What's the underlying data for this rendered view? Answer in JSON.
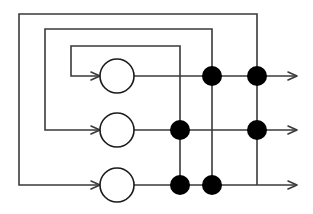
{
  "diagram": {
    "type": "block-diagram",
    "canvas": {
      "width": 313,
      "height": 214
    },
    "style": {
      "background": "#ffffff",
      "line_color": "#3a3a3a",
      "node_fill": "#ffffff",
      "node_stroke": "#1a1a1a",
      "dot_fill": "#000000",
      "line_width": 1.6,
      "dot_radius": 10,
      "circle_radius": 17
    },
    "rows": [
      {
        "name": "row-1",
        "y": 76,
        "circle_cx": 117,
        "output_arrow_x": 297,
        "input_arrow_x": 100
      },
      {
        "name": "row-2",
        "y": 130,
        "circle_cx": 117,
        "output_arrow_x": 297,
        "input_arrow_x": 100
      },
      {
        "name": "row-3",
        "y": 185,
        "circle_cx": 117,
        "output_arrow_x": 297,
        "input_arrow_x": 100
      }
    ],
    "nodes": [
      {
        "name": "node-circle-1",
        "cx": 117,
        "cy": 76,
        "r": 17,
        "kind": "circle"
      },
      {
        "name": "node-circle-2",
        "cx": 117,
        "cy": 130,
        "r": 17,
        "kind": "circle"
      },
      {
        "name": "node-circle-3",
        "cx": 117,
        "cy": 185,
        "r": 17,
        "kind": "circle"
      }
    ],
    "dots": [
      {
        "name": "junction-dot-r1-c2",
        "cx": 212,
        "cy": 76,
        "r": 10
      },
      {
        "name": "junction-dot-r1-c3",
        "cx": 257,
        "cy": 76,
        "r": 10
      },
      {
        "name": "junction-dot-r2-c1",
        "cx": 180,
        "cy": 130,
        "r": 10
      },
      {
        "name": "junction-dot-r2-c3",
        "cx": 257,
        "cy": 130,
        "r": 10
      },
      {
        "name": "junction-dot-r3-c1",
        "cx": 180,
        "cy": 185,
        "r": 10
      },
      {
        "name": "junction-dot-r3-c2",
        "cx": 212,
        "cy": 185,
        "r": 10
      }
    ],
    "feedback_loops": [
      {
        "name": "feedback-loop-outer",
        "tap_x": 257,
        "top_y": 14,
        "left_x": 19,
        "target_row_y": 185
      },
      {
        "name": "feedback-loop-middle",
        "tap_x": 212,
        "top_y": 29,
        "left_x": 45,
        "target_row_y": 130
      },
      {
        "name": "feedback-loop-inner",
        "tap_x": 180,
        "top_y": 46,
        "left_x": 71,
        "target_row_y": 76
      }
    ],
    "vertical_links": [
      {
        "name": "vlink-c1-r2-to-r3",
        "x": 180,
        "y1": 130,
        "y2": 185
      },
      {
        "name": "vlink-c2-r1-to-r3",
        "x": 212,
        "y1": 76,
        "y2": 185
      },
      {
        "name": "vlink-c3-r1-to-r3",
        "x": 257,
        "y1": 76,
        "y2": 185
      }
    ]
  }
}
